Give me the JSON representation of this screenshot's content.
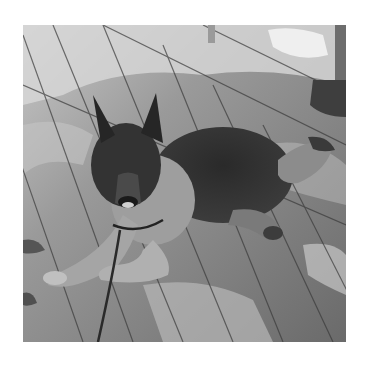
{
  "image": {
    "subject": "German Shepherd dog lying on a wooden deck",
    "style": "grayscale photograph",
    "scene": {
      "surface": "diagonal wooden deck planks",
      "lighting": "dappled sunlight and shade",
      "background_objects": [
        "metal post base",
        "white fabric/cushion",
        "chair leg"
      ],
      "accessories": [
        "leash",
        "collar"
      ]
    },
    "palette": {
      "deck_light": "#b5b5b5",
      "deck_mid": "#8a8a8a",
      "deck_dark": "#5e5e5e",
      "plank_line": "#3a3a3a",
      "dog_dark": "#2a2a2a",
      "dog_tan": "#a8a8a8",
      "highlight": "#e8e8e8",
      "background": "#ffffff"
    }
  }
}
